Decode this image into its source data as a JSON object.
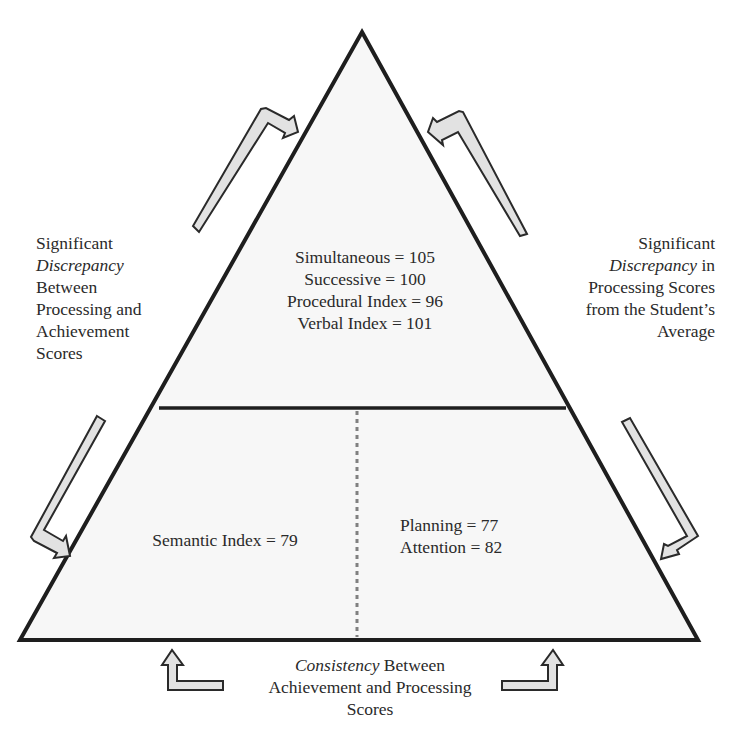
{
  "pyramid": {
    "upper_section": {
      "scores": [
        {
          "text": "Simultaneous = 105"
        },
        {
          "text": "Successive = 100"
        },
        {
          "text": "Procedural Index = 96"
        },
        {
          "text": "Verbal Index = 101"
        }
      ]
    },
    "lower_left_section": {
      "scores": [
        {
          "text": "Semantic Index = 79"
        }
      ]
    },
    "lower_right_section": {
      "scores": [
        {
          "text": "Planning = 77"
        },
        {
          "text": "Attention = 82"
        }
      ]
    }
  },
  "annotations": {
    "left": {
      "line1": "Significant",
      "line2_italic": "Discrepancy",
      "line3": "Between",
      "line4": "Processing and",
      "line5": "Achievement",
      "line6": "Scores"
    },
    "right": {
      "line1": "Significant",
      "line2_italic": "Discrepancy",
      "line2_rest": " in",
      "line3": "Processing Scores",
      "line4": "from the Student’s",
      "line5": "Average"
    },
    "bottom": {
      "line1_italic": "Consistency",
      "line1_rest": " Between",
      "line2": "Achievement and Processing",
      "line3": "Scores"
    }
  },
  "colors": {
    "outline": "#1e1e1e",
    "arrow_fill": "#e2e2e2",
    "triangle_fill": "#f7f7f7",
    "divider_dotted": "#808080"
  }
}
